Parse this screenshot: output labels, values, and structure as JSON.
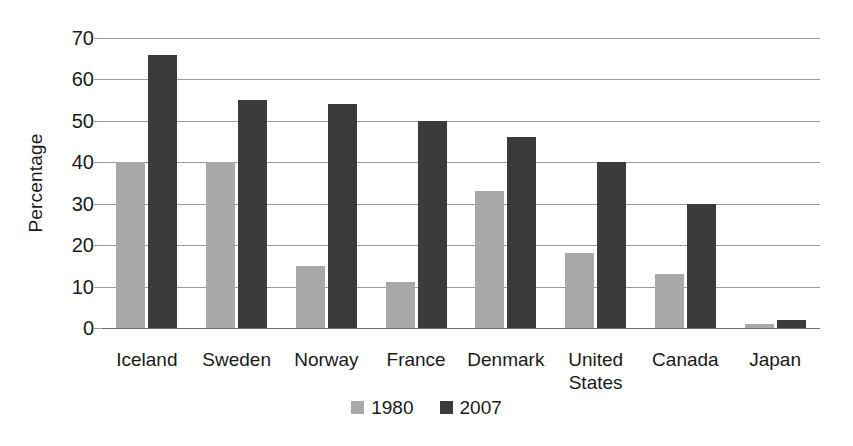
{
  "chart_data": {
    "type": "bar",
    "title": "",
    "subtitle": "",
    "xlabel": "",
    "ylabel": "Percentage",
    "ylim": [
      0,
      70
    ],
    "ytick_step": 10,
    "yticks": [
      70,
      60,
      50,
      40,
      30,
      20,
      10,
      0
    ],
    "ytick_labels": [
      "70",
      "60",
      "50",
      "40",
      "30",
      "20",
      "10",
      "0"
    ],
    "grid": true,
    "grid_axis": "y",
    "legend_position": "bottom-center",
    "categories": [
      "Iceland",
      "Sweden",
      "Norway",
      "France",
      "Denmark",
      "United States",
      "Canada",
      "Japan"
    ],
    "category_display": [
      "Iceland",
      "Sweden",
      "Norway",
      "France",
      "Denmark",
      "United\nStates",
      "Canada",
      "Japan"
    ],
    "series": [
      {
        "name": "1980",
        "color": "#a9a9a9",
        "values": [
          40,
          40,
          15,
          11,
          33,
          18,
          13,
          1
        ]
      },
      {
        "name": "2007",
        "color": "#3b3b3b",
        "values": [
          66,
          55,
          54,
          50,
          46,
          40,
          30,
          2
        ]
      }
    ],
    "annotations": []
  },
  "legend": {
    "items": [
      {
        "label": "1980",
        "swatch": "legend-swatch-1980"
      },
      {
        "label": "2007",
        "swatch": "legend-swatch-2007"
      }
    ]
  },
  "colors": {
    "series_1980": "#a9a9a9",
    "series_2007": "#3b3b3b",
    "gridline": "#9b9b9b",
    "axis": "#6e6e6e",
    "text": "#1a1a1a",
    "background": "#ffffff"
  }
}
